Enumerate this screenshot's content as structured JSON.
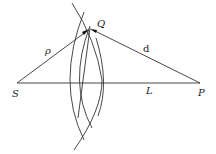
{
  "diagram": {
    "points": {
      "S": {
        "label": "S"
      },
      "P": {
        "label": "P"
      },
      "Q": {
        "label": "Q"
      }
    },
    "segments": {
      "SQ": {
        "label": "ρ"
      },
      "QP": {
        "label": "d"
      },
      "SP": {
        "label": "L"
      }
    },
    "wavefront_arc_count": 3
  }
}
